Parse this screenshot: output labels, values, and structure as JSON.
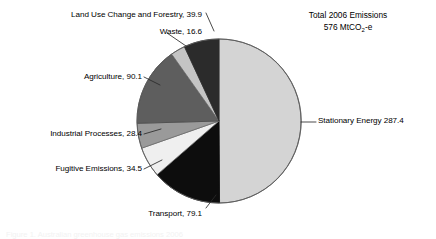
{
  "chart_data": {
    "type": "pie",
    "title": "Total 2006 Emissions 576 MtCO2-e",
    "title_line1": "Total 2006 Emissions",
    "title_line2_prefix": "576 MtCO",
    "title_line2_sub": "2",
    "title_line2_suffix": "-e",
    "total": 576,
    "units": "MtCO2-e",
    "year": 2006,
    "xlabel": "",
    "ylabel": "",
    "grid": false,
    "legend_position": "none",
    "start_angle_deg": 0,
    "direction": "clockwise",
    "categories": [
      "Stationary Energy",
      "Transport",
      "Fugitive Emissions",
      "Industrial Processes",
      "Agriculture",
      "Waste",
      "Land Use Change and Forestry"
    ],
    "values": [
      287.4,
      79.1,
      34.5,
      28.4,
      90.1,
      16.6,
      39.9
    ],
    "slices": [
      {
        "name": "Stationary Energy",
        "value": 287.4,
        "label": "Stationary Energy 287.4",
        "color": "#d4d4d4",
        "angle_deg": 179.6
      },
      {
        "name": "Transport",
        "value": 79.1,
        "label": "Transport, 79.1",
        "color": "#0d0d0d",
        "angle_deg": 49.4
      },
      {
        "name": "Fugitive Emissions",
        "value": 34.5,
        "label": "Fugitive Emissions, 34.5",
        "color": "#efefef",
        "angle_deg": 21.6
      },
      {
        "name": "Industrial Processes",
        "value": 28.4,
        "label": "Industrial Processes, 28.4",
        "color": "#9a9a9a",
        "angle_deg": 17.8
      },
      {
        "name": "Agriculture",
        "value": 90.1,
        "label": "Agriculture, 90.1",
        "color": "#5e5e5e",
        "angle_deg": 56.3
      },
      {
        "name": "Waste",
        "value": 16.6,
        "label": "Waste, 16.6",
        "color": "#c4c4c4",
        "angle_deg": 10.4
      },
      {
        "name": "Land Use Change and Forestry",
        "value": 39.9,
        "label": "Land Use Change and Forestry, 39.9",
        "color": "#2b2b2b",
        "angle_deg": 24.9
      }
    ]
  },
  "labels": {
    "stationary": "Stationary Energy 287.4",
    "transport": "Transport, 79.1",
    "fugitive": "Fugitive Emissions, 34.5",
    "industrial": "Industrial Processes, 28.4",
    "agriculture": "Agriculture, 90.1",
    "waste": "Waste, 16.6",
    "landuse": "Land Use Change and Forestry, 39.9"
  },
  "footer": {
    "ghost_text": "Figure 1. Australian greenhouse gas emissions 2006"
  }
}
